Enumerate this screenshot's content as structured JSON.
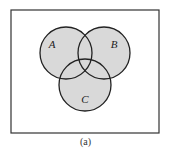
{
  "figure": {
    "caption": "(a)",
    "universe": {
      "x": 11,
      "y": 10,
      "width": 148,
      "height": 123,
      "stroke": "#333333"
    },
    "fill_color": "#d9d9d9",
    "stroke_color": "#222222",
    "sets": [
      {
        "label": "A",
        "cx": 66,
        "cy": 53,
        "r": 26,
        "label_x": 52,
        "label_y": 48
      },
      {
        "label": "B",
        "cx": 104,
        "cy": 53,
        "r": 26,
        "label_x": 114,
        "label_y": 48
      },
      {
        "label": "C",
        "cx": 85,
        "cy": 85,
        "r": 26,
        "label_x": 85,
        "label_y": 103
      }
    ]
  }
}
